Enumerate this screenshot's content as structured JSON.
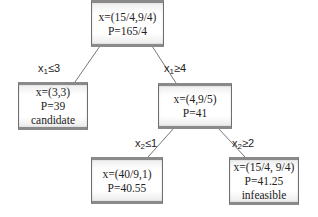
{
  "nodes": {
    "root": {
      "x": "x=(15/4,9/4)",
      "p": "P=165/4"
    },
    "left": {
      "x": "x=(3,3)",
      "p": "P=39",
      "status": "candidate"
    },
    "right": {
      "x": "x=(4,9/5)",
      "p": "P=41"
    },
    "right_left": {
      "x": "x=(40/9,1)",
      "p": "P=40.55"
    },
    "right_right": {
      "x": "x=(15/4, 9/4)",
      "p": "P=41.25",
      "status": "infeasible"
    }
  },
  "edges": {
    "root_left": {
      "var": "x",
      "sub": "1",
      "cond": "≤3"
    },
    "root_right": {
      "var": "x",
      "sub": "1",
      "cond": "≥4"
    },
    "right_left": {
      "var": "x",
      "sub": "2",
      "cond": "≤1"
    },
    "right_right": {
      "var": "x",
      "sub": "2",
      "cond": "≥2"
    }
  }
}
